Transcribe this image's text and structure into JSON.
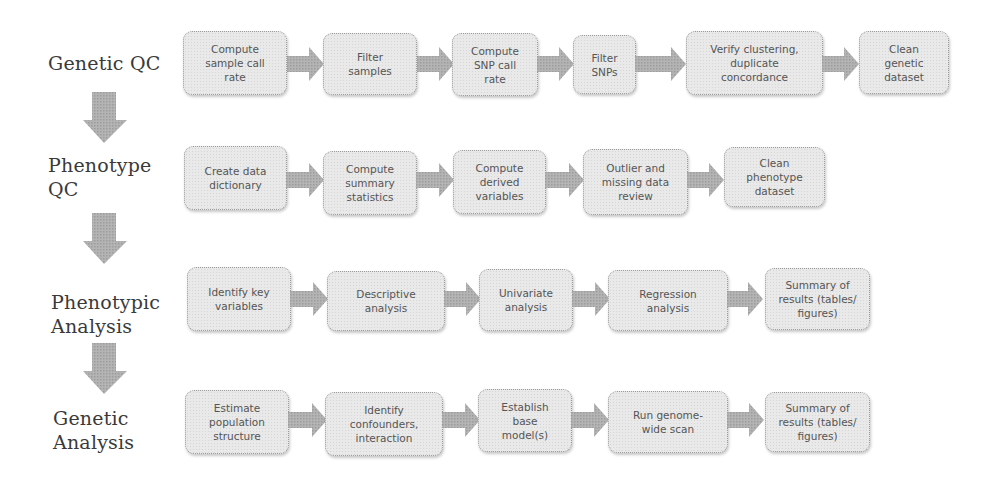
{
  "colors": {
    "box_fill": "#e9e9e9",
    "box_border": "#9a9a9a",
    "arrow_fill": "#a8a8a8",
    "label_text": "#3a3a3a",
    "box_text": "#555555"
  },
  "stages": [
    {
      "label": "Genetic QC",
      "steps": [
        "Compute\nsample call\nrate",
        "Filter\nsamples",
        "Compute\nSNP call\nrate",
        "Filter\nSNPs",
        "Verify clustering,\nduplicate\nconcordance",
        "Clean\ngenetic\ndataset"
      ]
    },
    {
      "label": "Phenotype\nQC",
      "steps": [
        "Create data\ndictionary",
        "Compute\nsummary\nstatistics",
        "Compute\nderived\nvariables",
        "Outlier and\nmissing data\nreview",
        "Clean\nphenotype\ndataset"
      ]
    },
    {
      "label": "Phenotypic\nAnalysis",
      "steps": [
        "Identify key\nvariables",
        "Descriptive\nanalysis",
        "Univariate\nanalysis",
        "Regression\nanalysis",
        "Summary of\nresults (tables/\nfigures)"
      ]
    },
    {
      "label": "Genetic\nAnalysis",
      "steps": [
        "Estimate\npopulation\nstructure",
        "Identify\nconfounders,\ninteraction",
        "Establish\nbase\nmodel(s)",
        "Run genome-\nwide scan",
        "Summary of\nresults (tables/\nfigures)"
      ]
    }
  ]
}
